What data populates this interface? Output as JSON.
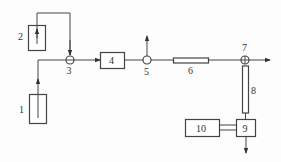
{
  "diagram": {
    "type": "process-flow",
    "components": [
      {
        "id": "1",
        "label": "1",
        "shape": "vertical-box"
      },
      {
        "id": "2",
        "label": "2",
        "shape": "vertical-box"
      },
      {
        "id": "3",
        "label": "3",
        "shape": "circle-junction"
      },
      {
        "id": "4",
        "label": "4",
        "shape": "box"
      },
      {
        "id": "5",
        "label": "5",
        "shape": "circle-junction"
      },
      {
        "id": "6",
        "label": "6",
        "shape": "horizontal-tube"
      },
      {
        "id": "7",
        "label": "7",
        "shape": "circle-junction"
      },
      {
        "id": "8",
        "label": "8",
        "shape": "vertical-tube"
      },
      {
        "id": "9",
        "label": "9",
        "shape": "box"
      },
      {
        "id": "10",
        "label": "10",
        "shape": "box"
      }
    ],
    "connections": [
      {
        "from": "1",
        "to": "3"
      },
      {
        "from": "2",
        "to": "3"
      },
      {
        "from": "3",
        "to": "4"
      },
      {
        "from": "4",
        "to": "5"
      },
      {
        "from": "5",
        "to": "outlet-up"
      },
      {
        "from": "5",
        "to": "6"
      },
      {
        "from": "6",
        "to": "7"
      },
      {
        "from": "7",
        "to": "outlet-right"
      },
      {
        "from": "7",
        "to": "8"
      },
      {
        "from": "8",
        "to": "9"
      },
      {
        "from": "10",
        "to": "9"
      },
      {
        "from": "9",
        "to": "outlet-down"
      }
    ]
  }
}
